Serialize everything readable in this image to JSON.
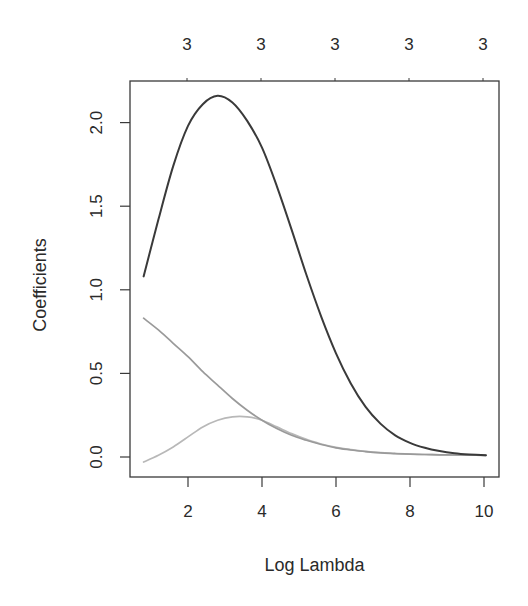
{
  "chart_data": {
    "type": "line",
    "title": "",
    "xlabel": "Log Lambda",
    "ylabel": "Coefficients",
    "xlim": [
      0.4,
      10.4
    ],
    "ylim": [
      -0.12,
      2.26
    ],
    "x_ticks": [
      2,
      4,
      6,
      8,
      10
    ],
    "x_tick_labels": [
      "2",
      "4",
      "6",
      "8",
      "10"
    ],
    "y_ticks": [
      0.0,
      0.5,
      1.0,
      1.5,
      2.0
    ],
    "y_tick_labels": [
      "0.0",
      "0.5",
      "1.0",
      "1.5",
      "2.0"
    ],
    "top_axis": {
      "label": "number of nonzero coefficients",
      "ticks": [
        2,
        4,
        6,
        8,
        10
      ],
      "tick_labels": [
        "3",
        "3",
        "3",
        "3",
        "3"
      ]
    },
    "grid": false,
    "legend": null,
    "series": [
      {
        "name": "coef-1",
        "color": "#3a3a3a",
        "x": [
          0.8,
          1.2,
          1.6,
          2.0,
          2.4,
          2.8,
          3.2,
          3.6,
          4.0,
          4.4,
          4.8,
          5.2,
          5.6,
          6.0,
          6.4,
          6.8,
          7.2,
          7.6,
          8.0,
          8.4,
          8.8,
          9.2,
          9.6,
          10.05
        ],
        "y": [
          1.08,
          1.42,
          1.74,
          1.98,
          2.11,
          2.16,
          2.12,
          2.01,
          1.85,
          1.62,
          1.36,
          1.09,
          0.84,
          0.62,
          0.44,
          0.3,
          0.2,
          0.13,
          0.085,
          0.055,
          0.035,
          0.022,
          0.015,
          0.01
        ]
      },
      {
        "name": "coef-2",
        "color": "#9a9a9a",
        "x": [
          0.8,
          1.2,
          1.6,
          2.0,
          2.4,
          2.8,
          3.2,
          3.6,
          4.0,
          4.4,
          4.8,
          5.2,
          5.6,
          6.0,
          6.4,
          6.8,
          7.2,
          7.6,
          8.0,
          8.4,
          8.8,
          9.2,
          9.6,
          10.05
        ],
        "y": [
          0.83,
          0.76,
          0.68,
          0.6,
          0.51,
          0.43,
          0.35,
          0.28,
          0.22,
          0.17,
          0.13,
          0.1,
          0.075,
          0.055,
          0.042,
          0.032,
          0.025,
          0.02,
          0.017,
          0.015,
          0.013,
          0.012,
          0.011,
          0.01
        ]
      },
      {
        "name": "coef-3",
        "color": "#b8b8b8",
        "x": [
          0.8,
          1.2,
          1.6,
          2.0,
          2.4,
          2.8,
          3.2,
          3.6,
          4.0,
          4.4,
          4.8,
          5.2,
          5.6,
          6.0,
          6.4,
          6.8,
          7.2,
          7.6,
          8.0,
          8.4,
          8.8,
          9.2,
          9.6,
          10.05
        ],
        "y": [
          -0.03,
          0.01,
          0.06,
          0.12,
          0.18,
          0.22,
          0.24,
          0.24,
          0.22,
          0.18,
          0.14,
          0.105,
          0.078,
          0.058,
          0.044,
          0.034,
          0.027,
          0.022,
          0.018,
          0.015,
          0.013,
          0.012,
          0.011,
          0.01
        ]
      }
    ]
  },
  "plot_area": {
    "left": 130,
    "top": 81,
    "right": 499,
    "bottom": 477
  },
  "colors": {
    "axis": "#3a3a3a",
    "background": "#ffffff"
  }
}
